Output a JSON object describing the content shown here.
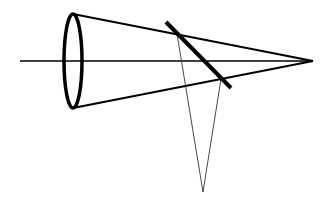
{
  "diagram": {
    "type": "geometric-optics-cone",
    "colors": {
      "background": "#ffffff",
      "stroke": "#000000",
      "thin_stroke": "#333333"
    },
    "optical_axis": {
      "x1": 20,
      "y1": 61,
      "x2": 313,
      "y2": 61
    },
    "aperture_ellipse": {
      "cx": 73,
      "cy": 61,
      "rx": 9,
      "ry": 47
    },
    "apex": {
      "x": 313,
      "y": 61
    },
    "cone_edges": [
      {
        "x1": 73,
        "y1": 14,
        "x2": 313,
        "y2": 61
      },
      {
        "x1": 73,
        "y1": 108,
        "x2": 313,
        "y2": 61
      }
    ],
    "tilted_plane": {
      "x1": 166,
      "y1": 22,
      "x2": 231,
      "y2": 88
    },
    "projection_point": {
      "x": 203,
      "y": 192
    },
    "projection_lines": [
      {
        "x1": 177,
        "y1": 34,
        "x2": 203,
        "y2": 192
      },
      {
        "x1": 221,
        "y1": 79,
        "x2": 203,
        "y2": 192
      }
    ]
  }
}
